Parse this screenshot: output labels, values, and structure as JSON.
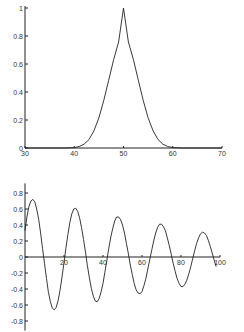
{
  "chart_data": [
    {
      "type": "line",
      "title": "",
      "xlabel": "",
      "ylabel": "",
      "xlim": [
        30,
        70
      ],
      "ylim": [
        0,
        1
      ],
      "x_ticks": [
        "30",
        "40",
        "50",
        "60",
        "70"
      ],
      "y_ticks": [
        "0",
        "0.2",
        "0.4",
        "0.6",
        "0.8",
        "1"
      ],
      "grid": false,
      "series": [
        {
          "name": "gaussian",
          "x": [
            30,
            32,
            34,
            36,
            38,
            40,
            41,
            42,
            43,
            44,
            45,
            46,
            47,
            48,
            49,
            50,
            51,
            52,
            53,
            54,
            55,
            56,
            57,
            58,
            59,
            60,
            62,
            64,
            66,
            68,
            70
          ],
          "y": [
            0,
            0,
            0,
            0,
            0,
            0.003,
            0.011,
            0.027,
            0.061,
            0.122,
            0.216,
            0.341,
            0.484,
            0.633,
            0.757,
            1.0,
            0.757,
            0.633,
            0.484,
            0.341,
            0.216,
            0.122,
            0.061,
            0.027,
            0.011,
            0.003,
            0,
            0,
            0,
            0,
            0
          ]
        }
      ]
    },
    {
      "type": "line",
      "title": "",
      "xlabel": "",
      "ylabel": "",
      "xlim": [
        0,
        100
      ],
      "ylim": [
        -0.9,
        0.9
      ],
      "x_ticks": [
        "20",
        "40",
        "60",
        "80",
        "100"
      ],
      "y_ticks": [
        "0.8",
        "0.6",
        "0.4",
        "0.2",
        "0",
        "-0.2",
        "-0.4",
        "-0.6",
        "-0.8"
      ],
      "grid": false,
      "series": [
        {
          "name": "damped-oscillation",
          "x": [
            0,
            1,
            2,
            3,
            4,
            5,
            6,
            7,
            8,
            9,
            10,
            11,
            12,
            13,
            14,
            15,
            16,
            17,
            18,
            19,
            20,
            21,
            22,
            23,
            24,
            25,
            26,
            27,
            28,
            29,
            30,
            31,
            32,
            33,
            34,
            35,
            36,
            37,
            38,
            39,
            40,
            41,
            42,
            43,
            44,
            45,
            46,
            47,
            48,
            49,
            50,
            51,
            52,
            53,
            54,
            55,
            56,
            57,
            58,
            59,
            60,
            61,
            62,
            63,
            64,
            65,
            66,
            67,
            68,
            69,
            70,
            71,
            72,
            73,
            74,
            75,
            76,
            77,
            78,
            79,
            80,
            81,
            82,
            83,
            84,
            85,
            86,
            87,
            88,
            89,
            90,
            91,
            92,
            93,
            94,
            95,
            96,
            97,
            98
          ],
          "y": [
            0.33,
            0.5,
            0.63,
            0.7,
            0.72,
            0.69,
            0.6,
            0.47,
            0.3,
            0.11,
            -0.08,
            -0.27,
            -0.44,
            -0.56,
            -0.64,
            -0.66,
            -0.63,
            -0.54,
            -0.41,
            -0.25,
            -0.07,
            0.11,
            0.28,
            0.43,
            0.54,
            0.6,
            0.61,
            0.57,
            0.49,
            0.37,
            0.22,
            0.06,
            -0.11,
            -0.26,
            -0.39,
            -0.49,
            -0.55,
            -0.56,
            -0.52,
            -0.44,
            -0.33,
            -0.19,
            -0.04,
            0.11,
            0.25,
            0.36,
            0.45,
            0.5,
            0.5,
            0.47,
            0.4,
            0.3,
            0.17,
            0.04,
            -0.1,
            -0.22,
            -0.33,
            -0.41,
            -0.45,
            -0.46,
            -0.43,
            -0.36,
            -0.27,
            -0.15,
            -0.03,
            0.09,
            0.2,
            0.3,
            0.37,
            0.41,
            0.41,
            0.38,
            0.33,
            0.24,
            0.14,
            0.03,
            -0.08,
            -0.18,
            -0.27,
            -0.33,
            -0.37,
            -0.37,
            -0.34,
            -0.29,
            -0.21,
            -0.12,
            -0.02,
            0.08,
            0.17,
            0.24,
            0.29,
            0.31,
            0.3,
            0.27,
            0.21,
            0.13,
            0.05,
            -0.04,
            -0.12
          ]
        }
      ]
    }
  ]
}
